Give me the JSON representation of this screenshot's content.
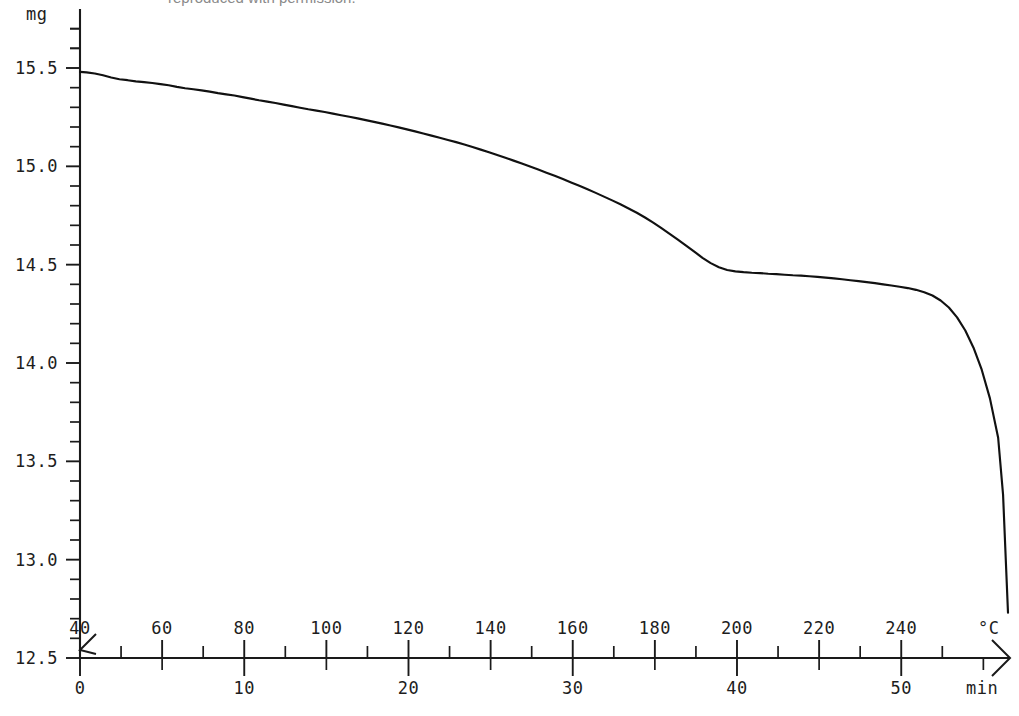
{
  "caption": {
    "text": "reproduced with permission."
  },
  "chart_data": {
    "type": "line",
    "title": "",
    "subtitle": "",
    "xlabel": "min",
    "ylabel": "mg",
    "secondary_xlabel": "°C",
    "grid": false,
    "legend": null,
    "axes": {
      "y": {
        "unit": "mg",
        "ticks": [
          "12.5",
          "13.0",
          "13.5",
          "14.0",
          "14.5",
          "15.0",
          "15.5"
        ],
        "tick_values": [
          12.5,
          13.0,
          13.5,
          14.0,
          14.5,
          15.0,
          15.5
        ],
        "minor_tick_step": 0.1,
        "ylim": [
          12.5,
          15.7
        ]
      },
      "x_time": {
        "unit": "min",
        "ticks": [
          "0",
          "10",
          "20",
          "30",
          "40",
          "50"
        ],
        "tick_values": [
          0,
          10,
          20,
          30,
          40,
          50
        ],
        "minor_tick_step": 5,
        "xlim": [
          0,
          56.5
        ],
        "position": "below-axis"
      },
      "x_temperature": {
        "unit": "°C",
        "ticks": [
          "40",
          "60",
          "80",
          "100",
          "120",
          "140",
          "160",
          "180",
          "200",
          "220",
          "240"
        ],
        "tick_values": [
          40,
          60,
          80,
          100,
          120,
          140,
          160,
          180,
          200,
          220,
          240
        ],
        "minor_tick_step": 10,
        "xlim": [
          40,
          266
        ],
        "position": "above-axis"
      }
    },
    "series": [
      {
        "name": "mass",
        "unit": "mg",
        "x_unit": "min",
        "x": [
          0.0,
          0.4,
          0.9,
          1.4,
          1.9,
          2.4,
          2.9,
          3.4,
          3.9,
          4.4,
          4.9,
          5.4,
          5.9,
          6.4,
          6.9,
          7.4,
          7.9,
          8.4,
          8.9,
          9.4,
          9.9,
          10.4,
          10.9,
          11.4,
          11.9,
          12.4,
          12.9,
          13.4,
          13.9,
          14.4,
          14.9,
          15.4,
          15.9,
          16.4,
          16.9,
          17.4,
          17.9,
          18.4,
          18.9,
          19.4,
          19.9,
          20.4,
          20.9,
          21.4,
          21.9,
          22.4,
          22.9,
          23.4,
          23.9,
          24.4,
          24.9,
          25.4,
          25.9,
          26.4,
          26.9,
          27.4,
          27.9,
          28.4,
          28.9,
          29.4,
          29.9,
          30.4,
          30.9,
          31.4,
          31.9,
          32.4,
          32.9,
          33.4,
          33.9,
          34.4,
          34.9,
          35.4,
          35.9,
          36.4,
          36.9,
          37.4,
          37.9,
          38.4,
          38.9,
          39.4,
          39.9,
          40.4,
          40.9,
          41.4,
          41.9,
          42.4,
          42.9,
          43.4,
          43.9,
          44.4,
          44.9,
          45.4,
          45.9,
          46.4,
          46.9,
          47.4,
          47.9,
          48.4,
          48.9,
          49.4,
          49.9,
          50.4,
          50.9,
          51.4,
          51.9,
          52.4,
          52.9,
          53.4,
          53.9,
          54.4,
          54.9,
          55.4,
          55.9,
          56.2,
          56.5
        ],
        "y": [
          15.48,
          15.478,
          15.472,
          15.463,
          15.452,
          15.443,
          15.438,
          15.432,
          15.428,
          15.424,
          15.418,
          15.412,
          15.404,
          15.397,
          15.392,
          15.386,
          15.38,
          15.372,
          15.366,
          15.36,
          15.352,
          15.344,
          15.336,
          15.329,
          15.322,
          15.314,
          15.306,
          15.298,
          15.29,
          15.283,
          15.276,
          15.268,
          15.26,
          15.252,
          15.244,
          15.235,
          15.226,
          15.217,
          15.208,
          15.198,
          15.188,
          15.178,
          15.167,
          15.156,
          15.145,
          15.134,
          15.123,
          15.111,
          15.098,
          15.085,
          15.072,
          15.058,
          15.044,
          15.029,
          15.014,
          14.999,
          14.984,
          14.968,
          14.952,
          14.935,
          14.918,
          14.901,
          14.883,
          14.865,
          14.846,
          14.827,
          14.807,
          14.786,
          14.764,
          14.74,
          14.714,
          14.686,
          14.657,
          14.627,
          14.597,
          14.566,
          14.535,
          14.508,
          14.487,
          14.473,
          14.466,
          14.462,
          14.459,
          14.457,
          14.454,
          14.452,
          14.449,
          14.446,
          14.444,
          14.441,
          14.438,
          14.434,
          14.43,
          14.426,
          14.421,
          14.416,
          14.411,
          14.406,
          14.4,
          14.394,
          14.388,
          14.381,
          14.372,
          14.36,
          14.343,
          14.318,
          14.282,
          14.232,
          14.165,
          14.078,
          13.966,
          13.82,
          13.62,
          13.33,
          12.73
        ],
        "style": "solid",
        "color": "#111111"
      }
    ],
    "annotations": [
      {
        "label": "first mass-loss step (shoulder)",
        "x_min": 34.4,
        "temperature_c": 170,
        "y_mg": 14.46
      },
      {
        "label": "plateau",
        "x_min_range": [
          35.5,
          50.0
        ],
        "temperature_c_range": [
          175,
          232
        ],
        "y_mg_range": [
          14.465,
          14.388
        ]
      },
      {
        "label": "final decomposition onset",
        "x_min": 51.0,
        "temperature_c": 236,
        "y_mg": 14.37
      }
    ]
  }
}
